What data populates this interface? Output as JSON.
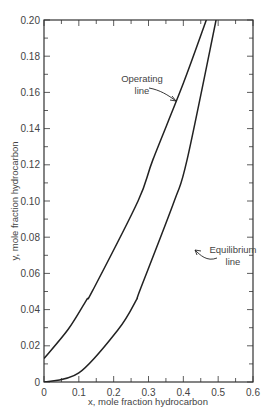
{
  "chart_data": {
    "type": "line",
    "title": "",
    "xlabel": "x, mole fraction hydrocarbon",
    "ylabel": "y, mole fraction hydrocarbon",
    "xlim": [
      0,
      0.6
    ],
    "ylim": [
      0,
      0.2
    ],
    "grid": false,
    "legend": "none (inline annotations)",
    "x_ticks": [
      "0",
      "0.1",
      "0.2",
      "0.3",
      "0.4",
      "0.5",
      "0.6"
    ],
    "y_ticks": [
      "0",
      "0.02",
      "0.04",
      "0.06",
      "0.08",
      "0.10",
      "0.12",
      "0.14",
      "0.16",
      "0.18",
      "0.20"
    ],
    "series": [
      {
        "name": "Operating line",
        "x": [
          0,
          0.069,
          0.121,
          0.141,
          0.27,
          0.313,
          0.4,
          0.466
        ],
        "y": [
          0.013,
          0.029,
          0.045,
          0.051,
          0.1,
          0.123,
          0.165,
          0.2
        ]
      },
      {
        "name": "Equilibrium line",
        "x": [
          0,
          0.1,
          0.213,
          0.264,
          0.276,
          0.374,
          0.411,
          0.494
        ],
        "y": [
          0,
          0.005,
          0.029,
          0.045,
          0.051,
          0.1,
          0.123,
          0.2
        ]
      }
    ],
    "annotations": [
      {
        "text_line1": "Operating",
        "text_line2": "line",
        "points_to": "Operating line"
      },
      {
        "text_line1": "Equilibrium",
        "text_line2": "line",
        "points_to": "Equilibrium line"
      }
    ]
  },
  "colors": {
    "line": "#222222",
    "axis": "#333333",
    "text": "#444444"
  }
}
